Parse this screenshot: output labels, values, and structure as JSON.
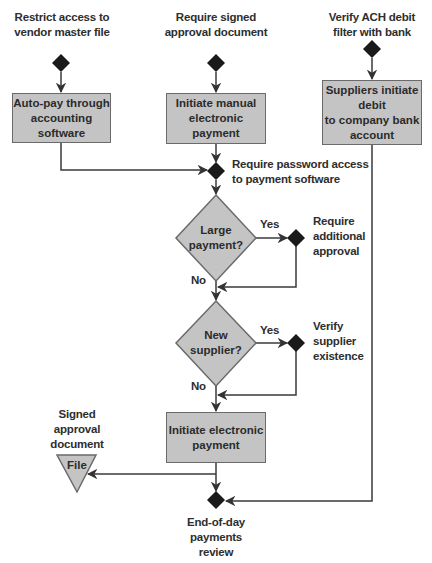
{
  "diagram": {
    "type": "flowchart",
    "colors": {
      "process_fill": "#c4c4c4",
      "control_diamond": "#1a1a1a",
      "line": "#333333"
    },
    "controls": {
      "restrict_access": "Restrict access to vendor master file",
      "restrict_access_lines": [
        "Restrict access to",
        "vendor master file"
      ],
      "signed_approval": "Require signed approval document",
      "signed_approval_lines": [
        "Require signed",
        "approval document"
      ],
      "ach_filter": "Verify ACH debit filter with bank",
      "ach_filter_lines": [
        "Verify ACH debit",
        "filter with bank"
      ],
      "password_access_lines": [
        "Require password access",
        "to payment software"
      ],
      "additional_approval_lines": [
        "Require",
        "additional",
        "approval"
      ],
      "verify_supplier_lines": [
        "Verify",
        "supplier",
        "existence"
      ],
      "eod_review_lines": [
        "End-of-day",
        "payments",
        "review"
      ]
    },
    "processes": {
      "auto_pay_lines": [
        "Auto-pay through",
        "accounting software"
      ],
      "manual_payment_lines": [
        "Initiate manual",
        "electronic payment"
      ],
      "supplier_debit_lines": [
        "Suppliers initiate debit",
        "to company bank",
        "account"
      ],
      "electronic_payment_lines": [
        "Initiate electronic",
        "payment"
      ]
    },
    "decisions": {
      "large_payment_lines": [
        "Large",
        "payment?"
      ],
      "new_supplier_lines": [
        "New",
        "supplier?"
      ],
      "yes_label": "Yes",
      "no_label": "No"
    },
    "file": {
      "label": "File",
      "document_lines": [
        "Signed",
        "approval",
        "document"
      ]
    }
  }
}
